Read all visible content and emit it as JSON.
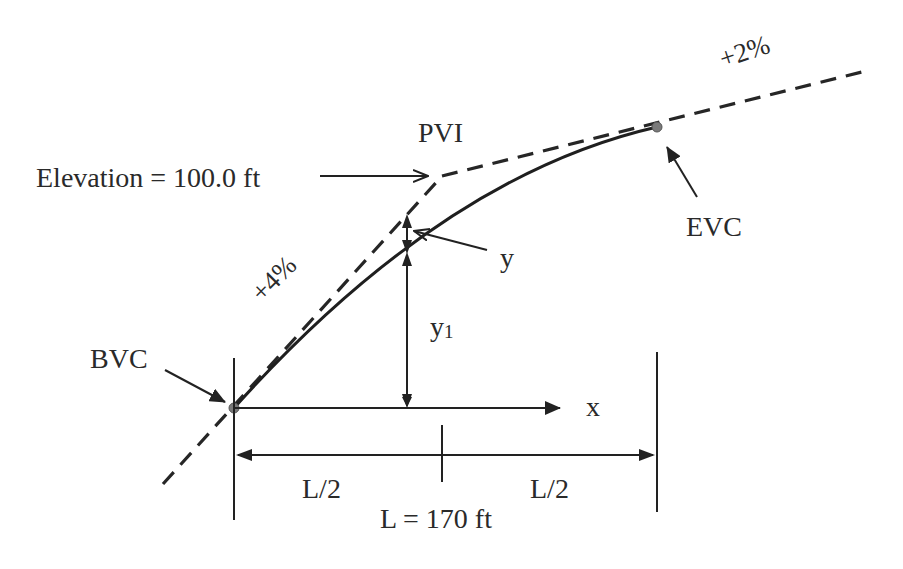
{
  "labels": {
    "elevation": "Elevation = 100.0 ft",
    "pvi": "PVI",
    "evc": "EVC",
    "bvc": "BVC",
    "grade_in": "+4%",
    "grade_out": "+2%",
    "y": "y",
    "y1_base": "y",
    "y1_sub": "1",
    "x": "x",
    "half_left": "L/2",
    "half_right": "L/2",
    "length": "L = 170 ft"
  },
  "values": {
    "pvi_elevation_ft": 100.0,
    "curve_length_ft": 170,
    "grade_in_percent": 4,
    "grade_out_percent": 2
  },
  "colors": {
    "line": "#222222",
    "point": "#7a7a7a",
    "text": "#2a2a2a"
  }
}
